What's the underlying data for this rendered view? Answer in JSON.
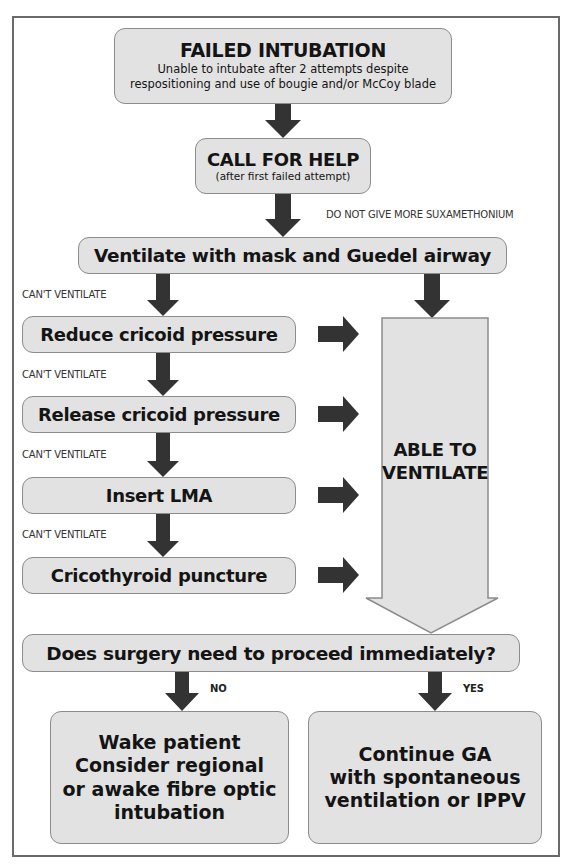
{
  "colors": {
    "box_fill": "#e2e2e2",
    "box_border": "#8c8c8c",
    "arrow": "#333333",
    "frame": "#6a6a6a",
    "text": "#141414"
  },
  "nodes": {
    "failed_intubation": {
      "title": "FAILED INTUBATION",
      "subtitle_line1": "Unable to intubate after 2 attempts despite",
      "subtitle_line2": "respositioning and use of bougie and/or McCoy blade"
    },
    "call_for_help": {
      "title": "CALL FOR HELP",
      "subtitle": "(after first failed attempt)"
    },
    "ventilate": {
      "title": "Ventilate with mask and Guedel airway"
    },
    "reduce_cricoid": {
      "title": "Reduce cricoid pressure"
    },
    "release_cricoid": {
      "title": "Release cricoid pressure"
    },
    "insert_lma": {
      "title": "Insert LMA"
    },
    "cricothyroid": {
      "title": "Cricothyroid puncture"
    },
    "able_to_ventilate": {
      "line1": "ABLE TO",
      "line2": "VENTILATE"
    },
    "decision": {
      "title": "Does surgery need to proceed immediately?"
    },
    "wake_patient": {
      "line1": "Wake patient",
      "line2": "Consider regional",
      "line3": "or awake fibre optic",
      "line4": "intubation"
    },
    "continue_ga": {
      "line1": "Continue GA",
      "line2": "with spontaneous",
      "line3": "ventilation or IPPV"
    }
  },
  "edge_labels": {
    "no_sux": "DO NOT GIVE MORE SUXAMETHONIUM",
    "cant_ventilate": "CAN'T VENTILATE",
    "no": "NO",
    "yes": "YES"
  }
}
